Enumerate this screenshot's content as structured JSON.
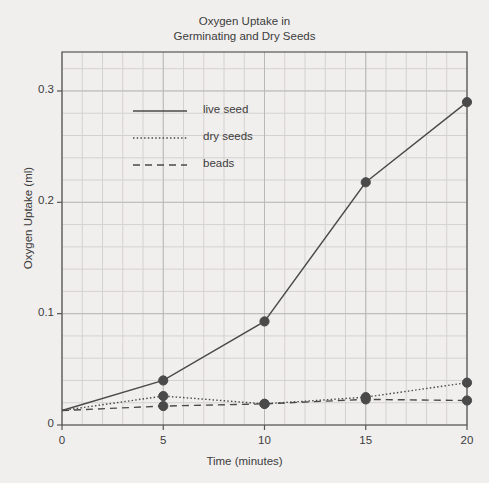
{
  "chart_data": {
    "type": "line",
    "title_line1": "Oxygen Uptake in",
    "title_line2": "Germinating and Dry Seeds",
    "xlabel": "Time (minutes)",
    "ylabel": "Oxygen Uptake (ml)",
    "xlim": [
      0,
      20
    ],
    "ylim": [
      0,
      0.335
    ],
    "xticks": [
      0,
      5,
      10,
      15,
      20
    ],
    "xtick_labels": [
      "0",
      "5",
      "10",
      "15",
      "20"
    ],
    "yticks": [
      0,
      0.1,
      0.2,
      0.3
    ],
    "ytick_labels": [
      "0",
      "0.1",
      "0.2",
      "0.3"
    ],
    "grid": true,
    "grid_minor_x_step": 1,
    "grid_minor_y_step": 0.02,
    "legend_position": "upper left inside",
    "marker": "filled-circle",
    "x": [
      0,
      5,
      10,
      15,
      20
    ],
    "series": [
      {
        "name": "live seed",
        "linestyle": "solid",
        "color": "#4a4a4a",
        "values": [
          0.013,
          0.04,
          0.093,
          0.218,
          0.29
        ],
        "markers_at": [
          5,
          10,
          15,
          20
        ]
      },
      {
        "name": "dry seeds",
        "linestyle": "dotted",
        "color": "#4a4a4a",
        "values": [
          0.013,
          0.026,
          0.019,
          0.025,
          0.038
        ],
        "markers_at": [
          5,
          10,
          15,
          20
        ]
      },
      {
        "name": "beads",
        "linestyle": "dashed",
        "color": "#4a4a4a",
        "values": [
          0.013,
          0.017,
          0.019,
          0.023,
          0.022
        ],
        "markers_at": [
          5,
          10,
          15,
          20
        ]
      }
    ]
  },
  "legend": {
    "items": [
      {
        "label": "live seed",
        "style": "solid"
      },
      {
        "label": "dry seeds",
        "style": "dotted"
      },
      {
        "label": "beads",
        "style": "dashed"
      }
    ]
  },
  "colors": {
    "background": "#f1efee",
    "axis": "#555555",
    "grid_major": "#b9b9b9",
    "grid_minor": "#d4d2d0",
    "line": "#4a4a4a",
    "text": "#3c3c3c"
  }
}
